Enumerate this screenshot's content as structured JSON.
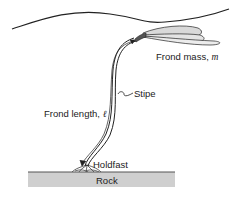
{
  "diagram": {
    "labels": {
      "frond_mass": "Frond mass, ",
      "frond_mass_symbol": "m",
      "stipe": "Stipe",
      "frond_length": "Frond length, ",
      "frond_length_symbol": "ℓ",
      "holdfast": "Holdfast",
      "rock": "Rock"
    },
    "colors": {
      "line": "#222222",
      "frond_fill": "#d9d9d9",
      "rock_fill": "#cfcfcf",
      "holdfast_knot": "#555555"
    }
  }
}
